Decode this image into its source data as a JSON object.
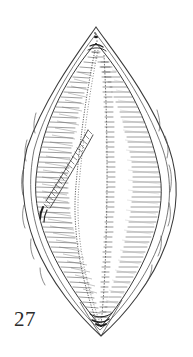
{
  "figure": {
    "label": "27",
    "caption_number": 27,
    "orientation": "vertical",
    "background_color": "#ffffff",
    "ink_color": "#333333",
    "light_ink_color": "#9a9a9a",
    "mid_ink_color": "#6b6b6b"
  },
  "illustration": {
    "outer_outline_name": "outer-frustule-contour",
    "inner_outline_name": "inner-valve-outline",
    "apex_top": {
      "x": 96,
      "y": 27
    },
    "apex_bottom": {
      "x": 101,
      "y": 336
    },
    "widest_left": {
      "x": 22,
      "y": 182
    },
    "widest_right": {
      "x": 177,
      "y": 178
    },
    "features": [
      {
        "name": "outer-contour",
        "description": "pointed lemon-shaped outer girdle line"
      },
      {
        "name": "inner-valve-outline",
        "description": "inner lens outline inset from outer contour"
      },
      {
        "name": "radial-striae",
        "description": "fine hatch lines radiating inward from valve margin"
      },
      {
        "name": "central-raphe",
        "description": "vertical median line with transverse dashes"
      },
      {
        "name": "secondary-raphe",
        "description": "second vertical dotted line left of centre"
      },
      {
        "name": "diagonal-ridge",
        "description": "oblique ladder-like ridge in left half"
      },
      {
        "name": "apical-pore",
        "description": "small dark mark near the upper apex"
      }
    ]
  },
  "counts": {
    "right_striae": 54,
    "left_striae": 54,
    "raphe_dashes": 62,
    "diagonal_rungs": 26
  }
}
